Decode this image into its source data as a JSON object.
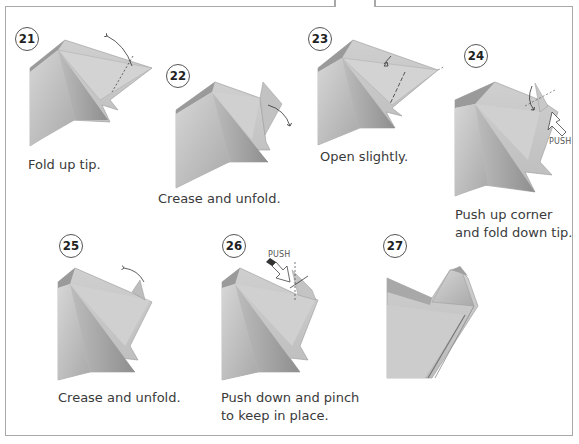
{
  "steps": [
    {
      "number": "21",
      "caption": "Fold up tip."
    },
    {
      "number": "22",
      "caption": "Crease and unfold."
    },
    {
      "number": "23",
      "caption": "Open slightly."
    },
    {
      "number": "24",
      "caption_line1": "Push up corner",
      "caption_line2": "and fold down tip.",
      "label": "PUSH"
    },
    {
      "number": "25",
      "caption": "Crease and unfold."
    },
    {
      "number": "26",
      "caption_line1": "Push down and pinch",
      "caption_line2": "to keep in place.",
      "label": "PUSH"
    },
    {
      "number": "27"
    }
  ],
  "colors": {
    "paper_light": "#cfcfcf",
    "paper_mid": "#b5b5b5",
    "paper_dark": "#8f8f8f",
    "border": "#a8a8a8"
  }
}
